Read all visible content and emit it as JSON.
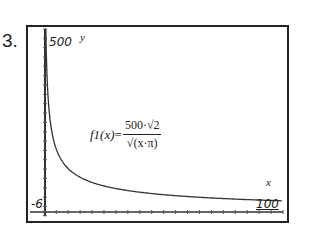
{
  "problem": {
    "number": "3."
  },
  "chart_data": {
    "type": "line",
    "title": "",
    "function_label": "f1(x)",
    "formula": {
      "numerator": "500·√2",
      "denominator": "√(x·π)"
    },
    "xlabel": "x",
    "ylabel": "y",
    "xlim": [
      -6,
      100
    ],
    "ylim": [
      -6,
      500
    ],
    "tick_labels": {
      "ymax": "500",
      "xmin": "-6",
      "xmax": "100"
    },
    "grid": false,
    "series": [
      {
        "name": "f1(x) = 500·√2 / √(x·π)",
        "x": [
          0.6,
          1,
          2,
          3,
          5,
          10,
          20,
          30,
          40,
          50,
          60,
          70,
          80,
          90,
          100
        ],
        "y": [
          515,
          399,
          282,
          230,
          178,
          126,
          89,
          73,
          63,
          56,
          52,
          48,
          45,
          42,
          40
        ]
      }
    ]
  }
}
